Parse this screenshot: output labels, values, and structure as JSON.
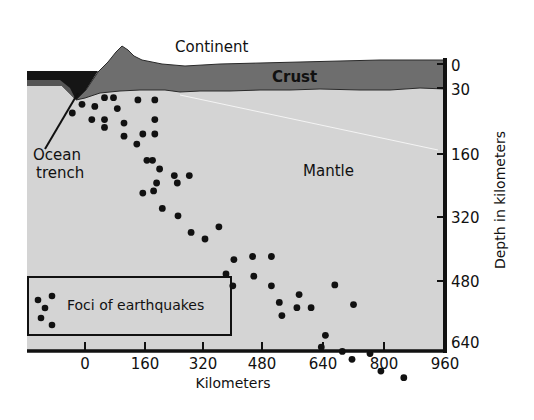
{
  "diagram": {
    "labels": {
      "continent": "Continent",
      "crust": "Crust",
      "mantle": "Mantle",
      "ocean_trench_line1": "Ocean",
      "ocean_trench_line2": "trench"
    },
    "legend": {
      "label": "Foci of earthquakes"
    },
    "x_axis": {
      "label": "Kilometers",
      "ticks": [
        "0",
        "160",
        "320",
        "480",
        "640",
        "800",
        "960"
      ]
    },
    "y_axis": {
      "label": "Depth in kilometers",
      "ticks": [
        "0",
        "30",
        "160",
        "320",
        "480",
        "640"
      ]
    },
    "colors": {
      "mantle": "#d4d4d4",
      "crust": "#6e6e6e",
      "ocean": "#151515",
      "foci": "#111111",
      "axis": "#111111"
    }
  },
  "chart_data": {
    "type": "scatter",
    "title": "",
    "xlabel": "Kilometers",
    "ylabel": "Depth in kilometers",
    "xlim": [
      -160,
      960
    ],
    "ylim": [
      640,
      0
    ],
    "x_ticks": [
      0,
      160,
      320,
      480,
      640,
      800,
      960
    ],
    "y_ticks": [
      0,
      30,
      160,
      320,
      480,
      640
    ],
    "legend": [
      "Foci of earthquakes"
    ],
    "annotations": [
      "Continent",
      "Crust",
      "Mantle",
      "Ocean trench"
    ],
    "series": [
      {
        "name": "Foci of earthquakes",
        "points": [
          [
            -34,
            112
          ],
          [
            -8,
            92
          ],
          [
            26,
            97
          ],
          [
            52,
            77
          ],
          [
            76,
            77
          ],
          [
            141,
            82
          ],
          [
            186,
            82
          ],
          [
            18,
            127
          ],
          [
            52,
            127
          ],
          [
            86,
            102
          ],
          [
            104,
            165
          ],
          [
            138,
            183
          ],
          [
            154,
            160
          ],
          [
            186,
            160
          ],
          [
            52,
            145
          ],
          [
            104,
            135
          ],
          [
            186,
            127
          ],
          [
            180,
            220
          ],
          [
            165,
            220
          ],
          [
            199,
            240
          ],
          [
            238,
            255
          ],
          [
            246,
            272
          ],
          [
            191,
            272
          ],
          [
            183,
            290
          ],
          [
            278,
            255
          ],
          [
            154,
            295
          ],
          [
            206,
            330
          ],
          [
            248,
            347
          ],
          [
            283,
            385
          ],
          [
            320,
            400
          ],
          [
            357,
            372
          ],
          [
            397,
            447
          ],
          [
            447,
            440
          ],
          [
            497,
            440
          ],
          [
            376,
            480
          ],
          [
            450,
            485
          ],
          [
            394,
            507
          ],
          [
            497,
            507
          ],
          [
            518,
            545
          ],
          [
            571,
            527
          ],
          [
            525,
            575
          ],
          [
            565,
            557
          ],
          [
            603,
            557
          ],
          [
            666,
            505
          ],
          [
            716,
            550
          ],
          [
            641,
            620
          ],
          [
            630,
            647
          ],
          [
            686,
            657
          ],
          [
            712,
            675
          ],
          [
            760,
            662
          ],
          [
            789,
            702
          ],
          [
            850,
            717
          ]
        ]
      }
    ]
  }
}
